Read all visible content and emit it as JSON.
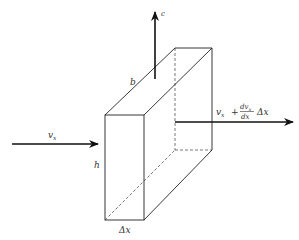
{
  "figure": {
    "labels": {
      "vertical_velocity": "c",
      "inflow_velocity": "v",
      "inflow_subscript": "x",
      "outflow_v": "v",
      "outflow_subscript": "x",
      "outflow_plus": "+",
      "outflow_numerator": "dv",
      "outflow_numerator_sub": "x",
      "outflow_denominator": "dx",
      "outflow_delta": "Δx",
      "width": "b",
      "height": "h",
      "thickness": "Δx"
    },
    "colors": {
      "line": "#222222",
      "arrow": "#111111",
      "hidden_edge": "#555555"
    }
  }
}
